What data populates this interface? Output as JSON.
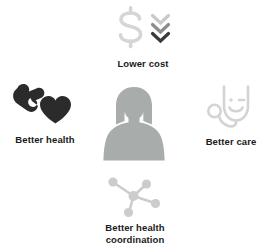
{
  "graphic": {
    "title": "Quadruple Aim healthcare goals",
    "background_color": "#ffffff",
    "center": {
      "name": "patient-silhouette",
      "icon": "person-silhouette-icon",
      "color": "#a8adab",
      "label": ""
    },
    "nodes": [
      {
        "id": "lower-cost",
        "label": "Lower cost",
        "icon": "dollar-sign-down-arrows-icon",
        "icon_colors": {
          "dollar": "#d6d6d6",
          "chevron_top": "#c9c9c9",
          "chevron_middle": "#8c8c8c",
          "chevron_bottom": "#3a3a3a"
        },
        "label_color": "#1a1a1a"
      },
      {
        "id": "better-health",
        "label": "Better health",
        "icon": "hand-holding-heart-icon",
        "icon_colors": {
          "hand": "#2b2b2b",
          "heart": "#2b2b2b"
        },
        "label_color": "#1a1a1a"
      },
      {
        "id": "better-care",
        "label": "Better care",
        "icon": "stethoscope-smiley-icon",
        "icon_colors": {
          "stroke": "#d4d4d4"
        },
        "label_color": "#1a1a1a"
      },
      {
        "id": "better-health-coordination",
        "label": "Better health\ncoordination",
        "icon": "network-nodes-icon",
        "icon_colors": {
          "nodes": "#cccccc",
          "links": "#cccccc"
        },
        "label_color": "#1a1a1a"
      }
    ]
  }
}
